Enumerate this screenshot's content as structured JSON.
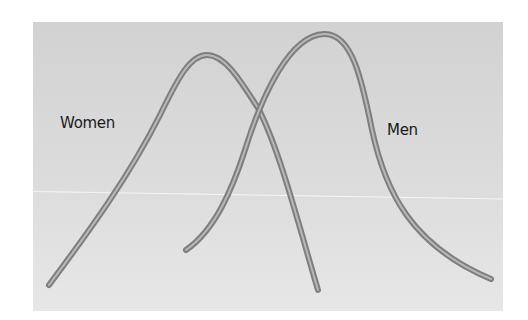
{
  "diagram": {
    "type": "distribution-curves",
    "background": "#d6d6d6",
    "curve_color": "#8a8a8a",
    "curve_highlight": "#bdbdbd",
    "labels": {
      "women": "Women",
      "men": "Men"
    }
  }
}
